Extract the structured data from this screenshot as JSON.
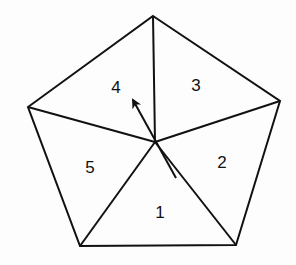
{
  "diagram": {
    "type": "pentagon divided into five triangles with rotation arrow",
    "vertices": {
      "top": [
        153,
        16
      ],
      "right": [
        280,
        101
      ],
      "bottom_right": [
        236,
        245
      ],
      "bottom_left": [
        80,
        246
      ],
      "left": [
        28,
        107
      ]
    },
    "center": [
      155,
      142
    ],
    "regions": [
      {
        "label": "1",
        "pos": [
          160,
          213
        ]
      },
      {
        "label": "2",
        "pos": [
          222,
          163
        ]
      },
      {
        "label": "3",
        "pos": [
          196,
          86
        ]
      },
      {
        "label": "4",
        "pos": [
          116,
          88
        ]
      },
      {
        "label": "5",
        "pos": [
          90,
          168
        ]
      }
    ],
    "arrow": {
      "from": [
        176,
        178
      ],
      "to": [
        131,
        97
      ]
    }
  }
}
